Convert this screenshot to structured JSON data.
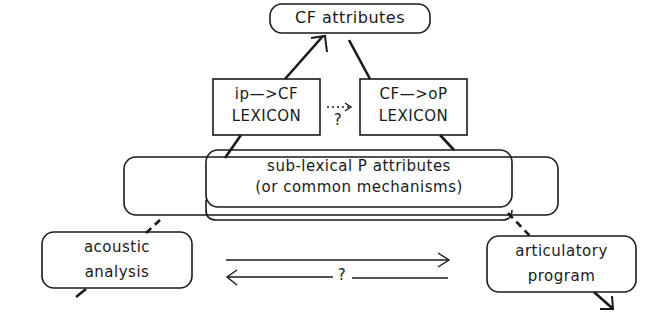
{
  "diagram": {
    "top_node": {
      "label": "CF attributes"
    },
    "lexicons": [
      {
        "line1": "ip—>CF",
        "line2": "LEXICON"
      },
      {
        "line1": "CF—>oP",
        "line2": "LEXICON"
      }
    ],
    "lexicon_link": {
      "arrow": "....>",
      "question": "?"
    },
    "middle_node": {
      "line1": "sub-lexical P attributes",
      "line2": "(or common mechanisms)"
    },
    "bottom_nodes": [
      {
        "line1": "acoustic",
        "line2": "analysis"
      },
      {
        "line1": "articulatory",
        "line2": "program"
      }
    ],
    "bottom_link": {
      "question": "?"
    },
    "colors": {
      "stroke": "#1a1a1a",
      "background": "#ffffff"
    }
  }
}
